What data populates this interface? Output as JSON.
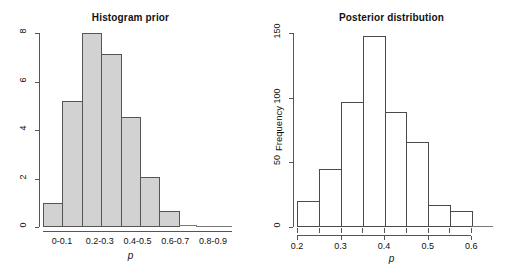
{
  "figure": {
    "background": "#ffffff",
    "panels": [
      "prior",
      "posterior"
    ]
  },
  "chart_data": [
    {
      "id": "prior",
      "type": "bar",
      "title": "Histogram prior",
      "xlabel": "p",
      "ylabel": "",
      "ylim": [
        0,
        8
      ],
      "xlim": [
        0,
        1.0
      ],
      "grid": false,
      "legend": null,
      "bin_width": 0.1,
      "bar_color": "#d2d2d2",
      "bar_border_color": "#555555",
      "categories": [
        "0-0.1",
        "0.1-0.2",
        "0.2-0.3",
        "0.3-0.4",
        "0.4-0.5",
        "0.5-0.6",
        "0.6-0.7",
        "0.7-0.8",
        "0.8-0.9",
        "0.9-1"
      ],
      "values": [
        1.0,
        5.2,
        8.0,
        7.15,
        4.55,
        2.05,
        0.65,
        0.07,
        0.0,
        0.0
      ],
      "ytick_labels": [
        "0",
        "2",
        "4",
        "6",
        "8"
      ],
      "ytick_values": [
        0,
        2,
        4,
        6,
        8
      ],
      "xtick_labels": [
        "0-0.1",
        "0.2-0.3",
        "0.4-0.5",
        "0.6-0.7",
        "0.8-0.9"
      ],
      "xtick_bins": [
        0,
        2,
        4,
        6,
        8
      ]
    },
    {
      "id": "posterior",
      "type": "bar",
      "title": "Posterior distribution",
      "xlabel": "p",
      "ylabel": "Frequency",
      "ylim": [
        0,
        150
      ],
      "xlim": [
        0.2,
        0.65
      ],
      "grid": false,
      "legend": null,
      "bin_width": 0.05,
      "bar_color": "#ffffff",
      "bar_border_color": "#4a4a4a",
      "categories": [
        "0.20-0.25",
        "0.25-0.30",
        "0.30-0.35",
        "0.35-0.40",
        "0.40-0.45",
        "0.45-0.50",
        "0.50-0.55",
        "0.55-0.60",
        "0.60-0.65"
      ],
      "values": [
        20,
        45,
        97,
        148,
        89,
        66,
        17,
        12,
        0
      ],
      "ytick_labels": [
        "0",
        "50",
        "100",
        "150"
      ],
      "ytick_values": [
        0,
        50,
        100,
        150
      ],
      "xtick_labels": [
        "0.2",
        "0.3",
        "0.4",
        "0.5",
        "0.6"
      ],
      "xtick_values": [
        0.2,
        0.3,
        0.4,
        0.5,
        0.6
      ]
    }
  ]
}
